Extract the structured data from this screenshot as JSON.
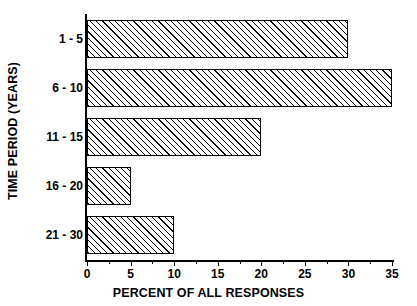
{
  "chart_data": {
    "type": "bar",
    "orientation": "horizontal",
    "title": "",
    "xlabel": "PERCENT OF ALL RESPONSES",
    "ylabel": "TIME PERIOD (YEARS)",
    "categories": [
      "1 - 5",
      "6 - 10",
      "11 - 15",
      "16 - 20",
      "21 - 30"
    ],
    "values": [
      30,
      35,
      20,
      5,
      10
    ],
    "xlim": [
      0,
      35
    ],
    "xticks": [
      0,
      5,
      10,
      15,
      20,
      25,
      30,
      35
    ],
    "xtick_labels": [
      "0",
      "5",
      "10",
      "15",
      "20",
      "25",
      "30",
      "35"
    ],
    "minor_xticks": [
      2.5,
      7.5,
      12.5,
      17.5,
      22.5,
      27.5,
      32.5
    ],
    "grid": false,
    "legend": null,
    "bar_style": {
      "fill": "#ffffff",
      "hatch": "forward-diagonal-45",
      "edge_color": "#000000"
    },
    "axis_color": "#000000",
    "background": "#ffffff"
  }
}
